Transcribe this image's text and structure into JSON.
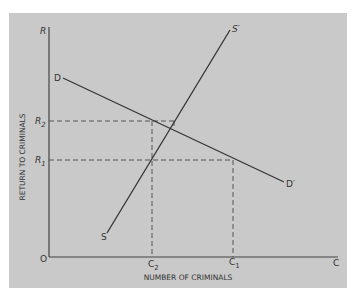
{
  "diagram": {
    "colors": {
      "background": "#c9c9c9",
      "ink": "#333333"
    },
    "axes": {
      "y_label": "RETURN TO CRIMINALS",
      "x_label": "NUMBER OF CRIMINALS",
      "y_axis_end": "R",
      "x_axis_end": "C",
      "origin": "O"
    },
    "curves": {
      "demand": {
        "start_label": "D",
        "end_label": "D′"
      },
      "supply": {
        "start_label": "S",
        "end_label": "S′"
      }
    },
    "y_ticks": {
      "r2": {
        "main": "R",
        "sub": "2"
      },
      "r1": {
        "main": "R",
        "sub": "1"
      }
    },
    "x_ticks": {
      "c2": {
        "main": "C",
        "sub": "2"
      },
      "c1": {
        "main": "C",
        "sub": "1"
      }
    }
  }
}
